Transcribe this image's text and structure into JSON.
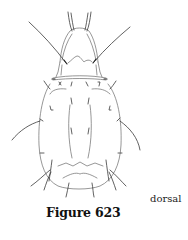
{
  "figure": {
    "caption": "Figure 623",
    "view_label": "dorsal",
    "line_color": "#6a6a6a",
    "seta_color": "#3a3a3a",
    "background": "#ffffff"
  }
}
